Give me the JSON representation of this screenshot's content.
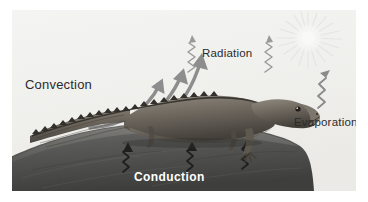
{
  "figure": {
    "background_color": "#f2f2f0",
    "page_background": "#ffffff"
  },
  "labels": {
    "convection": "Convection",
    "radiation": "Radiation",
    "evaporation": "Evaporation",
    "conduction": "Conduction"
  },
  "colors": {
    "label_dark": "#2b2b2b",
    "label_light": "#ffffff",
    "arrow_gray": "#8d8d8d",
    "zigzag_gray": "#9a9a9a",
    "zigzag_dark": "#2a2a2a",
    "rock_dark": "#4a4a4a",
    "rock_light": "#8a8a8a",
    "animal_body": "#6e6a62",
    "sky": "#f2f2f0",
    "sun_ray": "#e4e4e2"
  },
  "elements": {
    "animal": "lizard",
    "substrate": "rock",
    "sun": "sun-burst",
    "convection_arrows": 3,
    "radiation_waves": 2,
    "evaporation_waves": 1,
    "conduction_arrows": 3
  }
}
